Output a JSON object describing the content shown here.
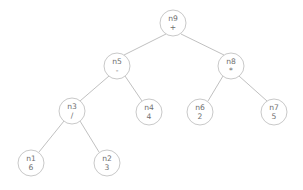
{
  "diagram": {
    "type": "binary-expression-tree",
    "background_color": "#ffffff",
    "node_stroke_color": "#c2c2c2",
    "node_fill_color": "#ffffff",
    "edge_color": "#b9b9b9",
    "text_color": "#6f6f6f",
    "node_radius": 13
  },
  "nodes": [
    {
      "id": "n9",
      "label": "n9",
      "value": "+",
      "kind": "operator",
      "cx": 173,
      "cy": 23,
      "depth": 0
    },
    {
      "id": "n5",
      "label": "n5",
      "value": "-",
      "kind": "operator",
      "cx": 117,
      "cy": 66,
      "depth": 1
    },
    {
      "id": "n8",
      "label": "n8",
      "value": "*",
      "kind": "operator",
      "cx": 231,
      "cy": 66,
      "depth": 1
    },
    {
      "id": "n3",
      "label": "n3",
      "value": "/",
      "kind": "operator",
      "cx": 72,
      "cy": 111,
      "depth": 2
    },
    {
      "id": "n4",
      "label": "n4",
      "value": "4",
      "kind": "operand",
      "cx": 149,
      "cy": 112,
      "depth": 2
    },
    {
      "id": "n6",
      "label": "n6",
      "value": "2",
      "kind": "operand",
      "cx": 200,
      "cy": 112,
      "depth": 2
    },
    {
      "id": "n7",
      "label": "n7",
      "value": "5",
      "kind": "operand",
      "cx": 274,
      "cy": 112,
      "depth": 2
    },
    {
      "id": "n1",
      "label": "n1",
      "value": "6",
      "kind": "operand",
      "cx": 31,
      "cy": 163,
      "depth": 3
    },
    {
      "id": "n2",
      "label": "n2",
      "value": "3",
      "kind": "operand",
      "cx": 107,
      "cy": 163,
      "depth": 3
    }
  ],
  "edges": [
    {
      "from": "n9",
      "to": "n5",
      "x1": 166,
      "y1": 34,
      "x2": 124,
      "y2": 55
    },
    {
      "from": "n9",
      "to": "n8",
      "x1": 181,
      "y1": 34,
      "x2": 224,
      "y2": 55
    },
    {
      "from": "n5",
      "to": "n3",
      "x1": 109,
      "y1": 76,
      "x2": 80,
      "y2": 101
    },
    {
      "from": "n5",
      "to": "n4",
      "x1": 125,
      "y1": 76,
      "x2": 142,
      "y2": 101
    },
    {
      "from": "n8",
      "to": "n6",
      "x1": 223,
      "y1": 76,
      "x2": 208,
      "y2": 101
    },
    {
      "from": "n8",
      "to": "n7",
      "x1": 239,
      "y1": 76,
      "x2": 267,
      "y2": 101
    },
    {
      "from": "n3",
      "to": "n1",
      "x1": 64,
      "y1": 121,
      "x2": 39,
      "y2": 152
    },
    {
      "from": "n3",
      "to": "n2",
      "x1": 80,
      "y1": 121,
      "x2": 99,
      "y2": 152
    }
  ]
}
